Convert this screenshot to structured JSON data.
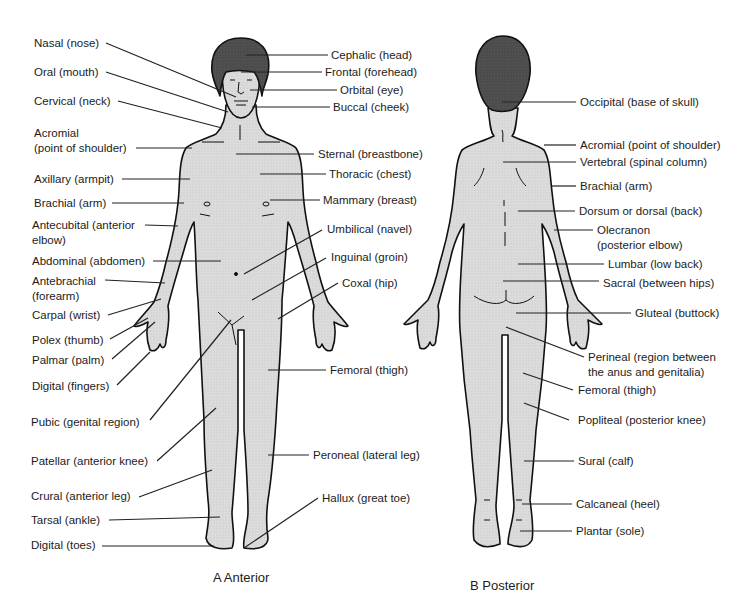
{
  "figure": {
    "colors": {
      "skin": "#d9d9d9",
      "hair": "#4a4a4a",
      "outline": "#111111",
      "leader": "#222222"
    },
    "anterior": {
      "caption": "A Anterior",
      "left_labels": [
        {
          "text": "Nasal (nose)",
          "x": 34,
          "y": 36
        },
        {
          "text": "Oral (mouth)",
          "x": 34,
          "y": 65
        },
        {
          "text": "Cervical (neck)",
          "x": 34,
          "y": 94
        },
        {
          "text": "Acromial",
          "x": 34,
          "y": 126
        },
        {
          "text": "(point of shoulder)",
          "x": 34,
          "y": 141
        },
        {
          "text": "Axillary (armpit)",
          "x": 34,
          "y": 172
        },
        {
          "text": "Brachial (arm)",
          "x": 34,
          "y": 196
        },
        {
          "text": "Antecubital (anterior",
          "x": 32,
          "y": 218
        },
        {
          "text": "elbow)",
          "x": 32,
          "y": 233
        },
        {
          "text": "Abdominal (abdomen)",
          "x": 32,
          "y": 254
        },
        {
          "text": "Antebrachial",
          "x": 32,
          "y": 274
        },
        {
          "text": "(forearm)",
          "x": 32,
          "y": 289
        },
        {
          "text": "Carpal (wrist)",
          "x": 32,
          "y": 308
        },
        {
          "text": "Polex (thumb)",
          "x": 32,
          "y": 333
        },
        {
          "text": "Palmar (palm)",
          "x": 32,
          "y": 353
        },
        {
          "text": "Digital (fingers)",
          "x": 32,
          "y": 379
        },
        {
          "text": "Pubic (genital region)",
          "x": 31,
          "y": 415
        },
        {
          "text": "Patellar (anterior knee)",
          "x": 31,
          "y": 454
        },
        {
          "text": "Crural (anterior leg)",
          "x": 31,
          "y": 489
        },
        {
          "text": "Tarsal (ankle)",
          "x": 31,
          "y": 513
        },
        {
          "text": "Digital (toes)",
          "x": 31,
          "y": 538
        }
      ],
      "right_labels": [
        {
          "text": "Cephalic (head)",
          "x": 331,
          "y": 49
        },
        {
          "text": "Frontal (forehead)",
          "x": 325,
          "y": 66
        },
        {
          "text": "Orbital (eye)",
          "x": 340,
          "y": 84
        },
        {
          "text": "Buccal (cheek)",
          "x": 333,
          "y": 101
        },
        {
          "text": "Sternal (breastbone)",
          "x": 318,
          "y": 147
        },
        {
          "text": "Thoracic (chest)",
          "x": 329,
          "y": 167
        },
        {
          "text": "Mammary (breast)",
          "x": 323,
          "y": 193
        },
        {
          "text": "Umbilical (navel)",
          "x": 327,
          "y": 222
        },
        {
          "text": "Inguinal (groin)",
          "x": 331,
          "y": 250
        },
        {
          "text": "Coxal (hip)",
          "x": 342,
          "y": 276
        },
        {
          "text": "Femoral (thigh)",
          "x": 330,
          "y": 363
        },
        {
          "text": "Peroneal (lateral leg)",
          "x": 313,
          "y": 448
        },
        {
          "text": "Hallux (great toe)",
          "x": 322,
          "y": 491
        }
      ]
    },
    "posterior": {
      "caption": "B Posterior",
      "right_labels": [
        {
          "text": "Occipital (base of skull)",
          "x": 580,
          "y": 96
        },
        {
          "text": "Acromial (point of shoulder)",
          "x": 580,
          "y": 138
        },
        {
          "text": "Vertebral (spinal column)",
          "x": 580,
          "y": 155
        },
        {
          "text": "Brachial (arm)",
          "x": 580,
          "y": 179
        },
        {
          "text": "Dorsum or dorsal (back)",
          "x": 579,
          "y": 204
        },
        {
          "text": "Olecranon",
          "x": 597,
          "y": 224
        },
        {
          "text": "(posterior elbow)",
          "x": 597,
          "y": 239
        },
        {
          "text": "Lumbar (low back)",
          "x": 608,
          "y": 258
        },
        {
          "text": "Sacral (between hips)",
          "x": 603,
          "y": 277
        },
        {
          "text": "Gluteal (buttock)",
          "x": 635,
          "y": 307
        },
        {
          "text": "Perineal (region between",
          "x": 588,
          "y": 351
        },
        {
          "text": "the anus and genitalia)",
          "x": 588,
          "y": 366
        },
        {
          "text": "Femoral (thigh)",
          "x": 578,
          "y": 383
        },
        {
          "text": "Popliteal (posterior knee)",
          "x": 578,
          "y": 413
        },
        {
          "text": "Sural (calf)",
          "x": 578,
          "y": 455
        },
        {
          "text": "Calcaneal (heel)",
          "x": 576,
          "y": 498
        },
        {
          "text": "Plantar (sole)",
          "x": 576,
          "y": 525
        }
      ]
    }
  }
}
